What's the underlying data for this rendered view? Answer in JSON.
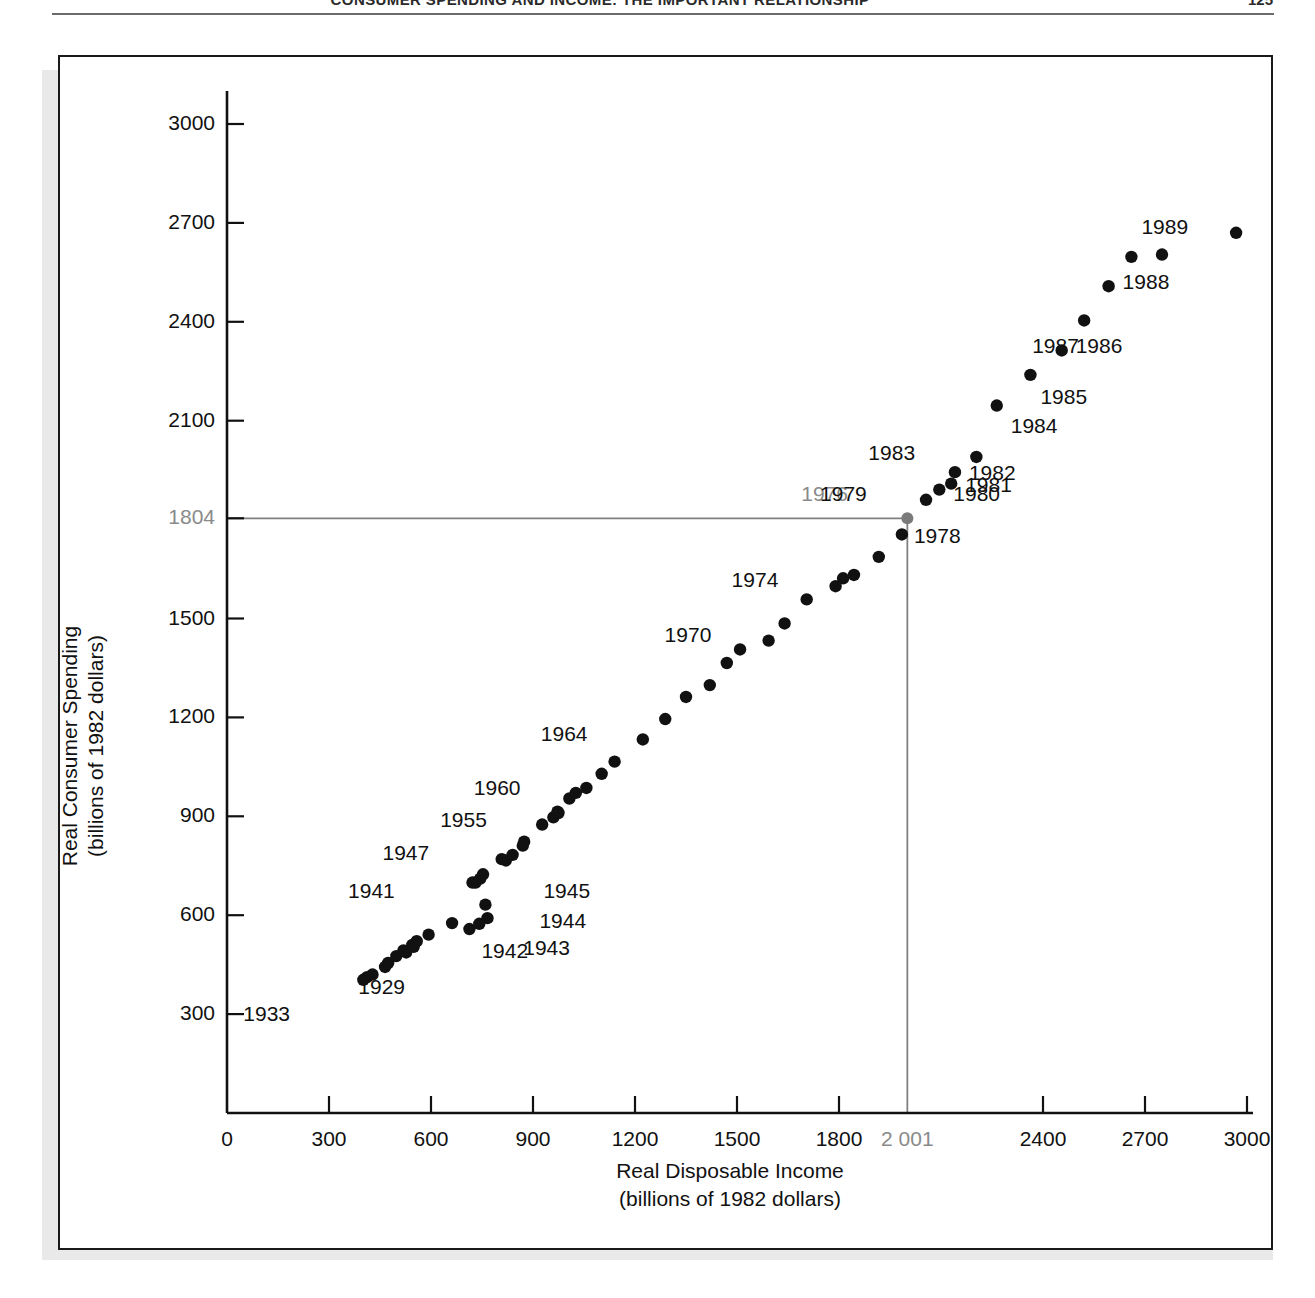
{
  "header": {
    "title": "CONSUMER SPENDING AND INCOME: THE IMPORTANT RELATIONSHIP",
    "page_number": "125"
  },
  "chart_data": {
    "type": "scatter",
    "title": "",
    "xlabel_line1": "Real Disposable Income",
    "xlabel_line2": "(billions of 1982 dollars)",
    "ylabel_line1": "Real Consumer Spending",
    "ylabel_line2": "(billions of 1982 dollars)",
    "xlim": [
      0,
      3000
    ],
    "ylim": [
      0,
      3150
    ],
    "grid": false,
    "legend": "none",
    "xticks": [
      0,
      300,
      600,
      900,
      1200,
      1500,
      1800,
      2001,
      2400,
      2700,
      3000
    ],
    "xtick_labels": [
      "0",
      "300",
      "600",
      "900",
      "1200",
      "1500",
      "1800",
      "2 001",
      "2400",
      "2700",
      "3000"
    ],
    "yticks": [
      300,
      600,
      900,
      1200,
      1500,
      1804,
      2100,
      2400,
      2700,
      3000
    ],
    "ytick_labels": [
      "300",
      "600",
      "900",
      "1200",
      "1500",
      "1804",
      "2100",
      "2400",
      "2700",
      "3000"
    ],
    "highlight_tick_x": "2 001",
    "highlight_tick_y": "1804",
    "highlight_color": "#8a8a8a",
    "point_color": "#111111",
    "reference_point": {
      "year": 1976,
      "x": 2001,
      "y": 1804
    },
    "reference_lines_note": "horizontal line at y=1804 and vertical line at x=2001 meeting at the 1976 point",
    "points": [
      {
        "year": 1929,
        "x": 545,
        "y": 510
      },
      {
        "year": 1930,
        "x": 498,
        "y": 476
      },
      {
        "year": 1931,
        "x": 474,
        "y": 455
      },
      {
        "year": 1932,
        "x": 412,
        "y": 412
      },
      {
        "year": 1933,
        "x": 401,
        "y": 404
      },
      {
        "year": 1934,
        "x": 428,
        "y": 420
      },
      {
        "year": 1935,
        "x": 465,
        "y": 443
      },
      {
        "year": 1936,
        "x": 527,
        "y": 487
      },
      {
        "year": 1937,
        "x": 549,
        "y": 504
      },
      {
        "year": 1938,
        "x": 519,
        "y": 493
      },
      {
        "year": 1939,
        "x": 558,
        "y": 521
      },
      {
        "year": 1940,
        "x": 593,
        "y": 541
      },
      {
        "year": 1941,
        "x": 662,
        "y": 576
      },
      {
        "year": 1942,
        "x": 713,
        "y": 558
      },
      {
        "year": 1943,
        "x": 742,
        "y": 574
      },
      {
        "year": 1944,
        "x": 766,
        "y": 591
      },
      {
        "year": 1945,
        "x": 760,
        "y": 632
      },
      {
        "year": 1946,
        "x": 731,
        "y": 699
      },
      {
        "year": 1947,
        "x": 722,
        "y": 699
      },
      {
        "year": 1948,
        "x": 745,
        "y": 711
      },
      {
        "year": 1949,
        "x": 753,
        "y": 724
      },
      {
        "year": 1950,
        "x": 808,
        "y": 770
      },
      {
        "year": 1951,
        "x": 820,
        "y": 766
      },
      {
        "year": 1952,
        "x": 840,
        "y": 783
      },
      {
        "year": 1953,
        "x": 870,
        "y": 811
      },
      {
        "year": 1954,
        "x": 874,
        "y": 823
      },
      {
        "year": 1955,
        "x": 927,
        "y": 875
      },
      {
        "year": 1956,
        "x": 960,
        "y": 897
      },
      {
        "year": 1957,
        "x": 975,
        "y": 910
      },
      {
        "year": 1958,
        "x": 972,
        "y": 914
      },
      {
        "year": 1959,
        "x": 1007,
        "y": 954
      },
      {
        "year": 1960,
        "x": 1026,
        "y": 971
      },
      {
        "year": 1961,
        "x": 1057,
        "y": 986
      },
      {
        "year": 1962,
        "x": 1102,
        "y": 1029
      },
      {
        "year": 1963,
        "x": 1140,
        "y": 1066
      },
      {
        "year": 1964,
        "x": 1223,
        "y": 1133
      },
      {
        "year": 1965,
        "x": 1289,
        "y": 1195
      },
      {
        "year": 1966,
        "x": 1350,
        "y": 1262
      },
      {
        "year": 1967,
        "x": 1420,
        "y": 1298
      },
      {
        "year": 1968,
        "x": 1470,
        "y": 1365
      },
      {
        "year": 1969,
        "x": 1509,
        "y": 1406
      },
      {
        "year": 1970,
        "x": 1593,
        "y": 1433
      },
      {
        "year": 1971,
        "x": 1640,
        "y": 1485
      },
      {
        "year": 1972,
        "x": 1705,
        "y": 1558
      },
      {
        "year": 1973,
        "x": 1812,
        "y": 1622
      },
      {
        "year": 1974,
        "x": 1790,
        "y": 1598
      },
      {
        "year": 1975,
        "x": 1844,
        "y": 1632
      },
      {
        "year": 1976,
        "x": 2001,
        "y": 1804
      },
      {
        "year": 1977,
        "x": 1917,
        "y": 1687
      },
      {
        "year": 1978,
        "x": 1985,
        "y": 1755
      },
      {
        "year": 1979,
        "x": 2056,
        "y": 1860
      },
      {
        "year": 1980,
        "x": 2095,
        "y": 1891
      },
      {
        "year": 1981,
        "x": 2130,
        "y": 1909
      },
      {
        "year": 1982,
        "x": 2141,
        "y": 1944
      },
      {
        "year": 1983,
        "x": 2204,
        "y": 1990
      },
      {
        "year": 1984,
        "x": 2264,
        "y": 2146
      },
      {
        "year": 1985,
        "x": 2363,
        "y": 2239
      },
      {
        "year": 1986,
        "x": 2455,
        "y": 2313
      },
      {
        "year": 1987,
        "x": 2521,
        "y": 2404
      },
      {
        "year": 1988,
        "x": 2593,
        "y": 2508
      },
      {
        "year": 1989,
        "x": 2660,
        "y": 2597
      },
      {
        "year": 1990,
        "x": 2750,
        "y": 2604
      },
      {
        "year": 1991,
        "x": 2968,
        "y": 2670
      }
    ],
    "labeled_points": [
      {
        "label": "1933",
        "anchor_x": 401,
        "anchor_y": 404,
        "dx": -74,
        "dy": 36
      },
      {
        "label": "1929",
        "anchor_x": 545,
        "anchor_y": 510,
        "dx": -8,
        "dy": 44
      },
      {
        "label": "1941",
        "anchor_x": 662,
        "anchor_y": 576,
        "dx": -58,
        "dy": -30
      },
      {
        "label": "1942",
        "anchor_x": 713,
        "anchor_y": 558,
        "dx": 12,
        "dy": 24
      },
      {
        "label": "1943",
        "anchor_x": 742,
        "anchor_y": 574,
        "dx": 44,
        "dy": 26
      },
      {
        "label": "1944",
        "anchor_x": 766,
        "anchor_y": 591,
        "dx": 52,
        "dy": 5
      },
      {
        "label": "1945",
        "anchor_x": 760,
        "anchor_y": 632,
        "dx": 58,
        "dy": -12
      },
      {
        "label": "1947",
        "anchor_x": 722,
        "anchor_y": 699,
        "dx": -44,
        "dy": -28
      },
      {
        "label": "1955",
        "anchor_x": 927,
        "anchor_y": 875,
        "dx": -56,
        "dy": -3
      },
      {
        "label": "1960",
        "anchor_x": 1026,
        "anchor_y": 971,
        "dx": -56,
        "dy": -3
      },
      {
        "label": "1964",
        "anchor_x": 1223,
        "anchor_y": 1133,
        "dx": -56,
        "dy": -3
      },
      {
        "label": "1970",
        "anchor_x": 1593,
        "anchor_y": 1433,
        "dx": -58,
        "dy": -4
      },
      {
        "label": "1974",
        "anchor_x": 1790,
        "anchor_y": 1598,
        "dx": -58,
        "dy": -4
      },
      {
        "label": "1976",
        "anchor_x": 2001,
        "anchor_y": 1804,
        "dx": -60,
        "dy": -22
      },
      {
        "label": "1978",
        "anchor_x": 1985,
        "anchor_y": 1755,
        "dx": 12,
        "dy": 4
      },
      {
        "label": "1979",
        "anchor_x": 2056,
        "anchor_y": 1860,
        "dx": -60,
        "dy": -4
      },
      {
        "label": "1980",
        "anchor_x": 2095,
        "anchor_y": 1891,
        "dx": 14,
        "dy": 6
      },
      {
        "label": "1981",
        "anchor_x": 2130,
        "anchor_y": 1909,
        "dx": 14,
        "dy": 3
      },
      {
        "label": "1982",
        "anchor_x": 2141,
        "anchor_y": 1944,
        "dx": 14,
        "dy": 3
      },
      {
        "label": "1983",
        "anchor_x": 2204,
        "anchor_y": 1990,
        "dx": -62,
        "dy": -2
      },
      {
        "label": "1984",
        "anchor_x": 2264,
        "anchor_y": 2146,
        "dx": 14,
        "dy": 22
      },
      {
        "label": "1985",
        "anchor_x": 2363,
        "anchor_y": 2239,
        "dx": 10,
        "dy": 24
      },
      {
        "label": "1986",
        "anchor_x": 2455,
        "anchor_y": 2313,
        "dx": 14,
        "dy": -2
      },
      {
        "label": "1987",
        "anchor_x": 2521,
        "anchor_y": 2404,
        "dx": -6,
        "dy": 28
      },
      {
        "label": "1988",
        "anchor_x": 2593,
        "anchor_y": 2508,
        "dx": 14,
        "dy": -2
      },
      {
        "label": "1989",
        "anchor_x": 2660,
        "anchor_y": 2597,
        "dx": 10,
        "dy": -28
      }
    ]
  }
}
